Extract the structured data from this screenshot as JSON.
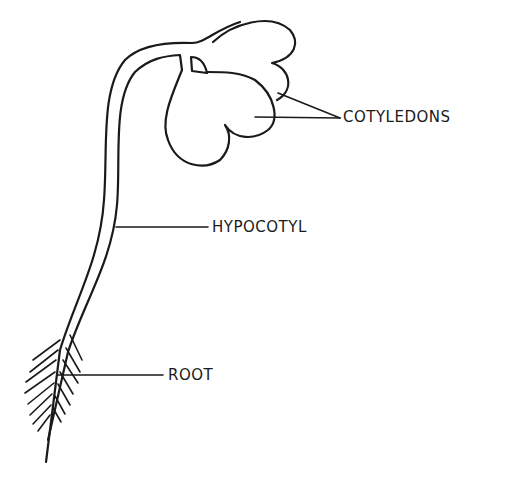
{
  "diagram": {
    "labels": {
      "cotyledons": "COTYLEDONS",
      "hypocotyl": "HYPOCOTYL",
      "root": "ROOT"
    },
    "colors": {
      "ink": "#1a1a1a",
      "background": "#ffffff"
    }
  }
}
